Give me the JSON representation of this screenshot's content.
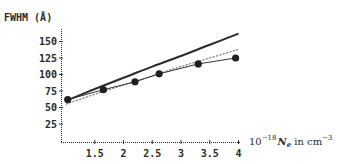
{
  "chart_data": {
    "type": "line",
    "title": "",
    "ylabel": "FWHM (Å)",
    "xlabel": "10^-18 N_e in cm^-3",
    "xlabel_parts": {
      "prefix": "10",
      "exponent": "−18",
      "symbol": "N",
      "subscript": "e",
      "unit_text": " in cm",
      "unit_exponent": "−3"
    },
    "x_ticks": [
      "1.5",
      "2",
      "2.5",
      "3",
      "3.5",
      "4"
    ],
    "x_tick_values": [
      1.5,
      2,
      2.5,
      3,
      3.5,
      4
    ],
    "y_ticks": [
      "25",
      "50",
      "75",
      "100",
      "125",
      "150"
    ],
    "y_tick_values": [
      25,
      50,
      75,
      100,
      125,
      150
    ],
    "xlim": [
      1.0,
      4.0
    ],
    "ylim": [
      0,
      165
    ],
    "grid": false,
    "legend": "none",
    "series": [
      {
        "name": "theory-solid",
        "style": "solid-thick",
        "x": [
          1.0,
          1.5,
          2.0,
          2.5,
          3.0,
          3.5,
          4.0
        ],
        "y": [
          60,
          78,
          95,
          112,
          128,
          145,
          162
        ]
      },
      {
        "name": "theory-dashed",
        "style": "dashed",
        "x": [
          1.0,
          1.5,
          2.0,
          2.5,
          3.0,
          3.5,
          4.0
        ],
        "y": [
          55,
          70,
          84,
          98,
          112,
          125,
          138
        ]
      },
      {
        "name": "experiment",
        "style": "solid-thin-with-markers",
        "x": [
          1.03,
          1.65,
          2.2,
          2.62,
          3.3,
          3.95
        ],
        "y": [
          62,
          77,
          89,
          101,
          116,
          125
        ]
      }
    ]
  }
}
